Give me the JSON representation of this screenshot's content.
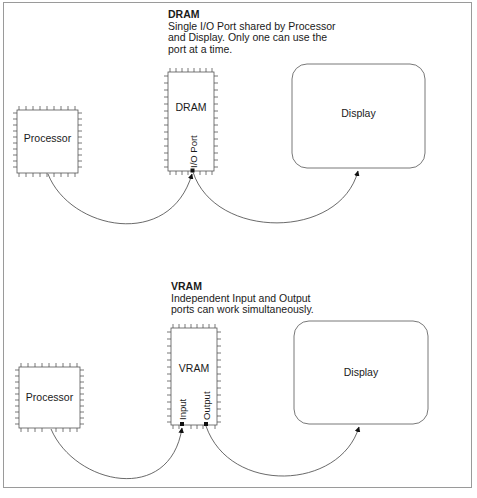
{
  "dram_section": {
    "title": "DRAM",
    "description": "Single I/O Port shared by Processor\nand Display. Only one can use the\nport at a time.",
    "processor_label": "Processor",
    "memory_label": "DRAM",
    "port_label": "I/O Port",
    "display_label": "Display"
  },
  "vram_section": {
    "title": "VRAM",
    "description": "Independent Input and Output\nports can work simultaneously.",
    "processor_label": "Processor",
    "memory_label": "VRAM",
    "input_port_label": "Input",
    "output_port_label": "Output",
    "display_label": "Display"
  },
  "colors": {
    "line": "#555555",
    "frame": "#9a9a9a",
    "text": "#1a1a1a"
  }
}
